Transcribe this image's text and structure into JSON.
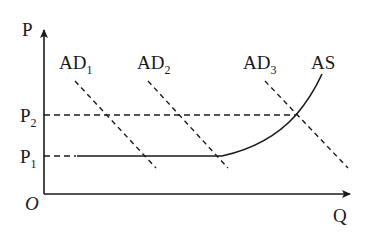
{
  "diagram": {
    "axes": {
      "y_label": "P",
      "x_label": "Q",
      "origin_label": "O"
    },
    "price_levels": [
      {
        "main": "P",
        "sub": "2"
      },
      {
        "main": "P",
        "sub": "1"
      }
    ],
    "curves": {
      "ad1": {
        "main": "AD",
        "sub": "1"
      },
      "ad2": {
        "main": "AD",
        "sub": "2"
      },
      "ad3": {
        "main": "AD",
        "sub": "3"
      },
      "as": {
        "main": "AS"
      }
    },
    "colors": {
      "ink": "#1a1a1a",
      "background": "#ffffff"
    }
  }
}
